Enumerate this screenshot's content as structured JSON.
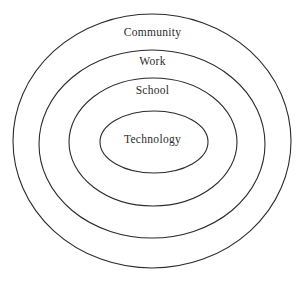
{
  "diagram": {
    "type": "concentric-circles",
    "background_color": "#ffffff",
    "stroke_color": "#2b2b2b",
    "text_color": "#2b2b2b",
    "stroke_width": 1,
    "center": {
      "x": 152,
      "y": 141
    },
    "rings": [
      {
        "id": "community",
        "label": "Community",
        "level": 1,
        "rx": 139,
        "ry": 127,
        "label_y": 33
      },
      {
        "id": "work",
        "label": "Work",
        "level": 2,
        "rx": 113,
        "ry": 94,
        "label_y": 62
      },
      {
        "id": "school",
        "label": "School",
        "level": 3,
        "rx": 84,
        "ry": 64,
        "label_y": 91
      },
      {
        "id": "technology",
        "label": "Technology",
        "level": 4,
        "rx": 54,
        "ry": 30,
        "label_y": 140
      }
    ]
  }
}
